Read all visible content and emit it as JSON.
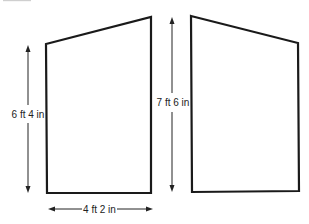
{
  "diagram": {
    "type": "dimensioned-shapes",
    "shapes": [
      {
        "name": "left-wall-panel",
        "dimensions": {
          "height": "6 ft 4 in",
          "width": "4 ft 2 in"
        }
      },
      {
        "name": "right-wall-panel",
        "dimensions": {
          "height": "7 ft 6 in"
        }
      }
    ],
    "labels": {
      "left_height": "6 ft 4 in",
      "bottom_width": "4 ft 2 in",
      "right_height": "7 ft 6 in"
    },
    "colors": {
      "line": "#1a1a1a",
      "background": "#ffffff"
    }
  }
}
